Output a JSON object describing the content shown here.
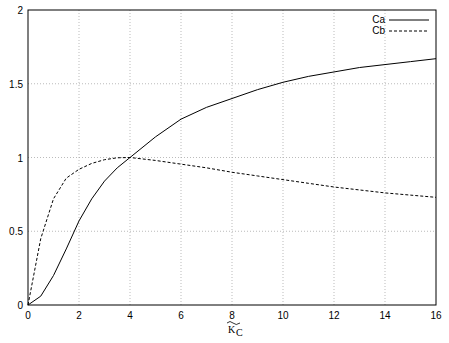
{
  "chart_data": {
    "type": "line",
    "title": "",
    "xlabel": "K_C (tilde)",
    "ylabel": "",
    "xlim": [
      0,
      16
    ],
    "ylim": [
      0,
      2
    ],
    "grid": true,
    "legend_position": "top-right",
    "x_ticks": [
      "0",
      "2",
      "4",
      "6",
      "8",
      "10",
      "12",
      "14",
      "16"
    ],
    "y_ticks": [
      "0",
      "0.5",
      "1",
      "1.5",
      "2"
    ],
    "x": [
      0,
      0.5,
      1,
      1.5,
      2,
      2.5,
      3,
      3.5,
      4,
      5,
      6,
      7,
      8,
      9,
      10,
      11,
      12,
      13,
      14,
      15,
      16
    ],
    "series": [
      {
        "name": "Ca",
        "style": "solid",
        "values": [
          0,
          0.06,
          0.2,
          0.38,
          0.57,
          0.72,
          0.84,
          0.93,
          1.0,
          1.14,
          1.26,
          1.34,
          1.4,
          1.46,
          1.51,
          1.55,
          1.58,
          1.61,
          1.63,
          1.65,
          1.67
        ]
      },
      {
        "name": "Cb",
        "style": "dashed",
        "values": [
          0,
          0.45,
          0.72,
          0.86,
          0.92,
          0.96,
          0.985,
          0.998,
          1.0,
          0.98,
          0.955,
          0.93,
          0.9,
          0.875,
          0.85,
          0.825,
          0.8,
          0.78,
          0.76,
          0.745,
          0.73
        ]
      }
    ]
  },
  "legend": {
    "items": [
      {
        "label": "Ca"
      },
      {
        "label": "Cb"
      }
    ]
  },
  "axis": {
    "x_label_main": "K",
    "x_label_sub": "C"
  }
}
